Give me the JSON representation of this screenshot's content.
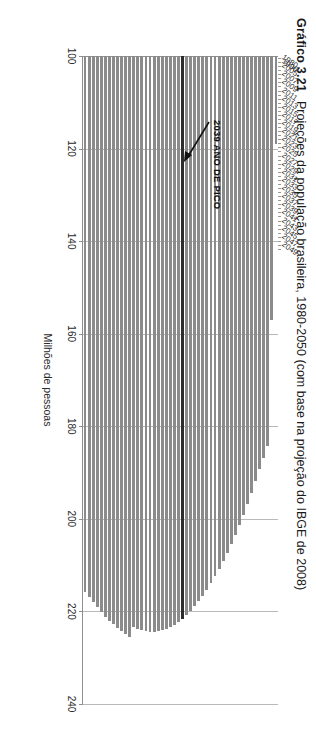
{
  "caption": {
    "number": "Gráfico 3.21",
    "title": "Projeções da população brasileira, 1980-2050 (com base na projeção do IBGE de 2008)"
  },
  "annotation": {
    "text": "2039 ANO DE PICO",
    "target_category": "2039"
  },
  "colors": {
    "bar": "#8b8b8b",
    "peak_bar": "#2c2c2c",
    "gridline": "#b9b9b9",
    "axis": "#8f8f8f",
    "text": "#2a2a2a"
  },
  "chart_data": {
    "type": "bar",
    "orientation": "vertical",
    "title": "Projeções da população brasileira, 1980-2050 (com base na projeção do IBGE de 2008)",
    "xlabel": "",
    "ylabel": "Milhões de pessoas",
    "ylim": [
      100,
      240
    ],
    "yticks": [
      100,
      120,
      140,
      160,
      180,
      200,
      220,
      240
    ],
    "grid": true,
    "legend": "none",
    "highlight_index": 23,
    "categories": [
      "1980",
      "1996",
      "2005",
      "2006",
      "2007",
      "2008",
      "2009",
      "2010",
      "2011",
      "2012",
      "2013",
      "2014",
      "2015",
      "2016",
      "2017",
      "2018",
      "2019",
      "2020",
      "2021",
      "2022",
      "2023",
      "2024",
      "2025",
      "2026",
      "2027",
      "2028",
      "2029",
      "2030",
      "2031",
      "2032",
      "2033",
      "2034",
      "2035",
      "2036",
      "2037",
      "2038",
      "2039",
      "2040",
      "2041",
      "2042",
      "2043",
      "2044",
      "2045",
      "2046",
      "2047",
      "2048",
      "2049",
      "2050"
    ],
    "tick_labels": [
      "1980",
      "1996",
      "2005",
      "",
      "2007",
      "",
      "2009",
      "",
      "2011",
      "",
      "2013",
      "",
      "2015",
      "",
      "2017",
      "",
      "2019",
      "",
      "2021",
      "",
      "2023",
      "",
      "2025",
      "",
      "2027",
      "",
      "2029",
      "",
      "2031",
      "",
      "2033",
      "",
      "2035",
      "",
      "2037",
      "",
      "2039",
      "",
      "2041",
      "",
      "2043",
      "",
      "2045",
      "",
      "2047",
      "",
      "2049",
      ""
    ],
    "values": [
      119.0,
      157.1,
      184.2,
      186.8,
      189.3,
      191.9,
      194.4,
      196.8,
      199.1,
      201.3,
      203.4,
      205.4,
      207.3,
      209.1,
      210.8,
      212.4,
      213.9,
      215.3,
      216.6,
      217.8,
      218.9,
      219.9,
      220.8,
      221.6,
      222.3,
      222.9,
      223.4,
      223.8,
      224.1,
      224.3,
      224.4,
      224.4,
      224.3,
      224.1,
      223.8,
      223.4,
      225.5,
      224.9,
      224.3,
      223.6,
      222.8,
      222.0,
      221.1,
      220.1,
      219.1,
      218.0,
      216.9,
      215.7
    ],
    "note": "Valor de pico em 2039 (barra destacada em escuro)."
  }
}
